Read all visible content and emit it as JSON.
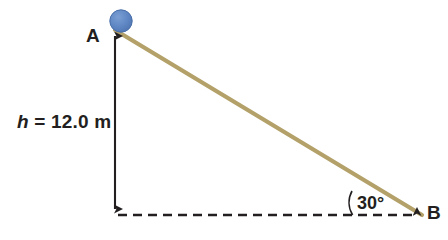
{
  "figure": {
    "background_color": "#ffffff",
    "points": {
      "top_label": "A",
      "bottom_label": "B"
    },
    "height_label": {
      "variable": "h",
      "equals": " = ",
      "value": "12.0",
      "unit": " m",
      "full_text": "h = 12.0 m"
    },
    "angle_label": {
      "value": "30",
      "unit": "°",
      "full_text": "30°"
    },
    "colors": {
      "incline": "#b3a169",
      "ball_fill": "#5e86c3",
      "ball_stroke": "#4a6fa8",
      "line": "#231f20",
      "text": "#231f20"
    },
    "geometry": {
      "point_a": [
        115,
        30
      ],
      "point_b": [
        422,
        215
      ],
      "height_arrow_top": [
        115,
        30
      ],
      "height_arrow_bottom": [
        115,
        215
      ],
      "baseline_start": [
        118,
        215
      ],
      "baseline_end": [
        424,
        215
      ],
      "ball_center": [
        121,
        21
      ],
      "ball_radius": 11,
      "angle_vertex": [
        352,
        215
      ],
      "angle_arc_radius": 24
    }
  }
}
